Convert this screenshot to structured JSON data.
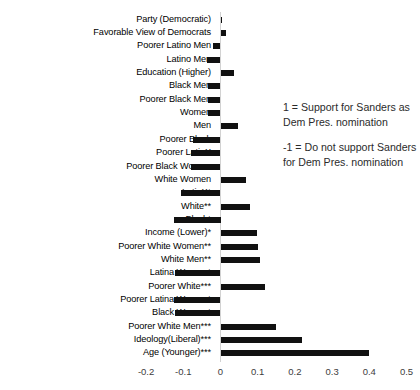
{
  "chart_data": {
    "type": "bar",
    "orientation": "horizontal",
    "title": "",
    "xlabel": "",
    "ylabel": "",
    "xlim": [
      -0.25,
      0.52
    ],
    "grid": false,
    "legend": null,
    "xticks": [
      "-0.2",
      "-0.1",
      "0",
      "0.1",
      "0.2",
      "0.3",
      "0.4",
      "0.5"
    ],
    "xtick_values": [
      -0.2,
      -0.1,
      0,
      0.1,
      0.2,
      0.3,
      0.4,
      0.5
    ],
    "categories": [
      "Party (Democratic)",
      "Favorable View of Democrats",
      "Poorer Latino Men",
      "Latino Men",
      "Education (Higher)",
      "Black Men",
      "Poorer Black Men",
      "Women",
      "Men",
      "Poorer Black",
      "Poorer LatinX",
      "Poorer Black Women",
      "White Women",
      "LatinX*",
      "White**",
      "Black*",
      "Income (Lower)*",
      "Poorer White Women**",
      "White Men**",
      "Latina Women*",
      "Poorer White***",
      "Poorer Latina Women*",
      "Black Women*",
      "Poorer White Men***",
      "Ideology(Liberal)***",
      "Age (Younger)***"
    ],
    "values": [
      0.001,
      0.014,
      -0.021,
      -0.037,
      0.035,
      -0.033,
      -0.034,
      -0.033,
      0.046,
      -0.075,
      -0.079,
      -0.078,
      0.068,
      -0.107,
      0.078,
      -0.125,
      0.099,
      0.1,
      0.106,
      -0.122,
      0.119,
      -0.126,
      -0.123,
      0.148,
      0.219,
      0.4
    ]
  },
  "annotation": {
    "positive_note": "1 = Support for Sanders as Dem Pres. nomination",
    "negative_note": "-1 = Do not support Sanders for Dem Pres. nomination"
  },
  "style": {
    "bar_color": "#111111",
    "axis_line_color": "#d2d2d2",
    "tick_text_color": "#3d3d3d"
  }
}
